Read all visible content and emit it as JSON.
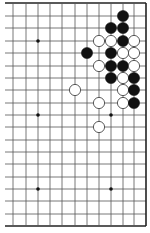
{
  "board": {
    "size": 19,
    "visible_columns": 12,
    "visible_rows": 19,
    "col_x": [
      1,
      13,
      26,
      38,
      50,
      62,
      75,
      87,
      99,
      111,
      123,
      134,
      146
    ],
    "row_y": [
      3,
      16,
      28,
      41,
      53,
      66,
      78,
      90,
      103,
      115,
      127,
      140,
      152,
      164,
      177,
      189,
      201,
      214,
      226
    ],
    "line_color": "#555555",
    "border_color": "#222222",
    "background": "#ffffff"
  },
  "star_points": [
    {
      "col": 3,
      "row": 3
    },
    {
      "col": 3,
      "row": 9
    },
    {
      "col": 9,
      "row": 9
    },
    {
      "col": 3,
      "row": 15
    },
    {
      "col": 9,
      "row": 15
    }
  ],
  "stones": [
    {
      "color": "black",
      "col": 10,
      "row": 1
    },
    {
      "color": "black",
      "col": 9,
      "row": 2
    },
    {
      "color": "black",
      "col": 10,
      "row": 2
    },
    {
      "color": "white",
      "col": 8,
      "row": 3
    },
    {
      "color": "white",
      "col": 9,
      "row": 3
    },
    {
      "color": "black",
      "col": 10,
      "row": 3
    },
    {
      "color": "white",
      "col": 11,
      "row": 3
    },
    {
      "color": "black",
      "col": 7,
      "row": 4
    },
    {
      "color": "black",
      "col": 9,
      "row": 4
    },
    {
      "color": "white",
      "col": 10,
      "row": 4
    },
    {
      "color": "white",
      "col": 11,
      "row": 4
    },
    {
      "color": "white",
      "col": 8,
      "row": 5
    },
    {
      "color": "black",
      "col": 9,
      "row": 5
    },
    {
      "color": "black",
      "col": 10,
      "row": 5
    },
    {
      "color": "white",
      "col": 11,
      "row": 5
    },
    {
      "color": "black",
      "col": 9,
      "row": 6
    },
    {
      "color": "white",
      "col": 10,
      "row": 6
    },
    {
      "color": "black",
      "col": 11,
      "row": 6
    },
    {
      "color": "white",
      "col": 6,
      "row": 7
    },
    {
      "color": "white",
      "col": 10,
      "row": 7
    },
    {
      "color": "black",
      "col": 11,
      "row": 7
    },
    {
      "color": "white",
      "col": 8,
      "row": 8
    },
    {
      "color": "white",
      "col": 10,
      "row": 8
    },
    {
      "color": "black",
      "col": 11,
      "row": 8
    },
    {
      "color": "white",
      "col": 8,
      "row": 10
    }
  ],
  "stone_colors": {
    "black": "#111111",
    "white": "#ffffff",
    "white_outline": "#333333"
  }
}
